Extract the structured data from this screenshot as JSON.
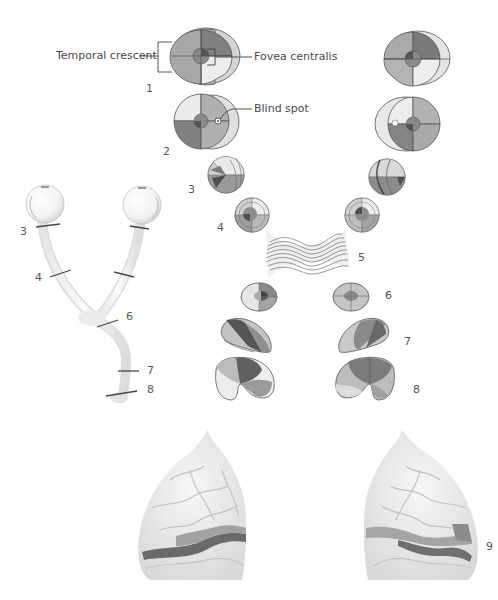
{
  "labels": {
    "temporal_crescent": "Temporal crescent",
    "fovea_centralis": "Fovea centralis",
    "blind_spot": "Blind spot"
  },
  "stage_numbers": {
    "n1": "1",
    "n2": "2",
    "n3_center": "3",
    "n4_center": "4",
    "n5": "5",
    "n6_center": "6",
    "n7_center": "7",
    "n8_center": "8",
    "n9": "9"
  },
  "pathway_numbers": {
    "n3": "3",
    "n4": "4",
    "n6": "6",
    "n7": "7",
    "n8": "8"
  },
  "stages": [
    {
      "id": 1,
      "name": "visual-field"
    },
    {
      "id": 2,
      "name": "retina"
    },
    {
      "id": 3,
      "name": "optic-nerve-proximal"
    },
    {
      "id": 4,
      "name": "optic-nerve-distal"
    },
    {
      "id": 5,
      "name": "optic-chiasm"
    },
    {
      "id": 6,
      "name": "optic-tract"
    },
    {
      "id": 7,
      "name": "lateral-geniculate-body-anterior"
    },
    {
      "id": 8,
      "name": "lateral-geniculate-body-posterior"
    },
    {
      "id": 9,
      "name": "visual-cortex"
    }
  ],
  "colors": {
    "dark": "#5a5a5a",
    "mid_dark": "#7d7d7d",
    "mid": "#a6a6a6",
    "light": "#cfcfcf",
    "very_light": "#ececec",
    "outline": "#555555",
    "nerve": "#eeeeee",
    "brain": "#e9e9e9"
  }
}
